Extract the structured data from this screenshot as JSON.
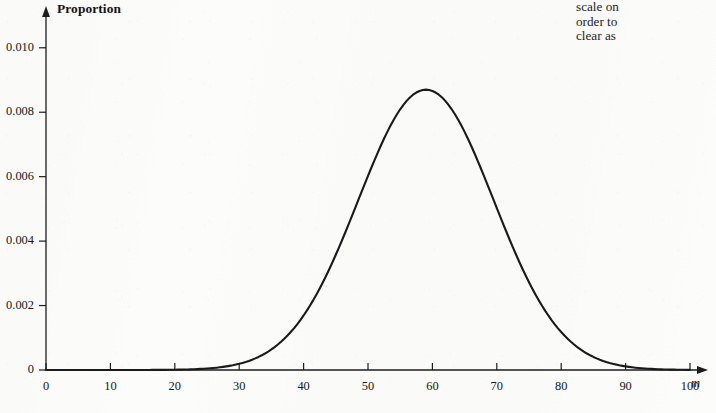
{
  "page": {
    "background_color": "#fcfcfb",
    "ink_color": "#1a1a1a"
  },
  "facing_page_text": {
    "lines": [
      "scale on",
      "order to",
      "clear as"
    ]
  },
  "chart_data": {
    "type": "line",
    "title": "",
    "subtitle": "",
    "xlabel": "m",
    "ylabel": "Proportion",
    "grid": false,
    "legend": null,
    "xlim": [
      0,
      100
    ],
    "ylim": [
      0,
      0.0108
    ],
    "x_ticks": [
      0,
      10,
      20,
      30,
      40,
      50,
      60,
      70,
      80,
      90,
      100
    ],
    "x_tick_labels": [
      "0",
      "10",
      "20",
      "30",
      "40",
      "50",
      "60",
      "70",
      "80",
      "90",
      "100"
    ],
    "y_ticks": [
      0,
      0.002,
      0.004,
      0.006,
      0.008,
      0.01
    ],
    "y_tick_labels": [
      "0",
      "0.002",
      "0.004",
      "0.006",
      "0.008",
      "0.010"
    ],
    "axis_arrows": {
      "x": true,
      "y": true
    },
    "curve": {
      "name": "Normal distribution of m",
      "distribution": "normal",
      "mean": 59,
      "std_dev": 10.5,
      "peak_value": 0.0087,
      "peak_x": 59,
      "line_color": "#1a1a1a",
      "line_width": 2.1,
      "x": [
        0,
        5,
        10,
        15,
        20,
        25,
        28,
        30,
        32,
        34,
        36,
        38,
        40,
        42,
        44,
        46,
        48,
        50,
        52,
        54,
        56,
        58,
        59,
        60,
        62,
        64,
        66,
        68,
        70,
        72,
        74,
        76,
        78,
        80,
        82,
        84,
        86,
        88,
        90,
        95,
        100
      ],
      "y": [
        0.0,
        0.0,
        0.0,
        0.0,
        0.0,
        1e-05,
        4e-05,
        8e-05,
        0.00015,
        0.00027,
        0.00045,
        0.00072,
        0.0011,
        0.00161,
        0.00226,
        0.00304,
        0.00392,
        0.00485,
        0.00578,
        0.00662,
        0.00732,
        0.00782,
        0.00798,
        0.00808,
        0.00816,
        0.00803,
        0.00768,
        0.00713,
        0.00643,
        0.00563,
        0.00478,
        0.00394,
        0.00315,
        0.00244,
        0.00183,
        0.00133,
        0.00093,
        0.00063,
        0.00041,
        0.0001,
        2e-05
      ]
    },
    "geometry": {
      "origin_px": {
        "x": 46,
        "y": 370
      },
      "x_px_per_unit": 6.27,
      "y_px_per_unit": 33250
    }
  }
}
